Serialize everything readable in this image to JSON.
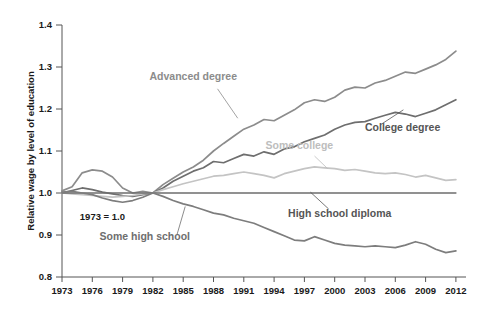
{
  "chart_data": {
    "type": "line",
    "title": "",
    "subtitle": "",
    "xlabel": "",
    "ylabel": "Relative wage by level of education",
    "xlim": [
      1973,
      2013
    ],
    "ylim": [
      0.8,
      1.4
    ],
    "grid": false,
    "legend_position": "inline-labels",
    "annotations": [
      {
        "text": "1973 = 1.0",
        "x": 1977,
        "y": 0.935
      }
    ],
    "xticks": [
      "1973",
      "1976",
      "1979",
      "1982",
      "1985",
      "1988",
      "1991",
      "1994",
      "1997",
      "2000",
      "2003",
      "2006",
      "2009",
      "2012"
    ],
    "yticks": [
      "0.8",
      "0.9",
      "1.0",
      "1.1",
      "1.2",
      "1.3",
      "1.4"
    ],
    "x": [
      1973,
      1974,
      1975,
      1976,
      1977,
      1978,
      1979,
      1980,
      1981,
      1982,
      1983,
      1984,
      1985,
      1986,
      1987,
      1988,
      1989,
      1990,
      1991,
      1992,
      1993,
      1994,
      1995,
      1996,
      1997,
      1998,
      1999,
      2000,
      2001,
      2002,
      2003,
      2004,
      2005,
      2006,
      2007,
      2008,
      2009,
      2010,
      2011,
      2012
    ],
    "series": [
      {
        "name": "Advanced degree",
        "color": "#8c8c8c",
        "label_color": "#8c8c8c",
        "label_x": 1986,
        "label_y": 1.268,
        "leader": {
          "x1": 1988.4,
          "y1": 1.248,
          "x2": 1990.4,
          "y2": 1.178
        },
        "values": [
          1.005,
          1.015,
          1.048,
          1.055,
          1.052,
          1.038,
          1.012,
          1.0,
          1.004,
          1.0,
          1.02,
          1.035,
          1.05,
          1.062,
          1.078,
          1.1,
          1.118,
          1.135,
          1.152,
          1.162,
          1.175,
          1.172,
          1.185,
          1.198,
          1.215,
          1.222,
          1.218,
          1.228,
          1.245,
          1.252,
          1.25,
          1.262,
          1.268,
          1.278,
          1.288,
          1.285,
          1.295,
          1.305,
          1.318,
          1.338
        ]
      },
      {
        "name": "College degree",
        "color": "#6e6e6e",
        "label_color": "#555555",
        "label_x": 2003,
        "label_y": 1.148,
        "leader": {
          "x1": 2004.5,
          "y1": 1.162,
          "x2": 2006.8,
          "y2": 1.198
        },
        "values": [
          1.0,
          1.006,
          1.012,
          1.008,
          1.002,
          0.998,
          0.994,
          0.992,
          0.996,
          1.0,
          1.012,
          1.028,
          1.04,
          1.052,
          1.06,
          1.075,
          1.072,
          1.082,
          1.092,
          1.088,
          1.098,
          1.092,
          1.105,
          1.11,
          1.122,
          1.13,
          1.138,
          1.152,
          1.162,
          1.168,
          1.17,
          1.178,
          1.185,
          1.192,
          1.188,
          1.182,
          1.19,
          1.198,
          1.21,
          1.222
        ]
      },
      {
        "name": "Some college",
        "color": "#c4c4c4",
        "label_color": "#bdbdbd",
        "label_x": 1996.5,
        "label_y": 1.105,
        "leader": {
          "x1": 1998.0,
          "y1": 1.088,
          "x2": 1999.3,
          "y2": 1.058
        },
        "values": [
          1.0,
          0.998,
          0.996,
          0.994,
          0.992,
          0.99,
          0.992,
          0.994,
          0.998,
          1.0,
          1.008,
          1.015,
          1.022,
          1.028,
          1.034,
          1.04,
          1.042,
          1.046,
          1.05,
          1.046,
          1.042,
          1.036,
          1.046,
          1.052,
          1.058,
          1.062,
          1.06,
          1.058,
          1.054,
          1.056,
          1.052,
          1.048,
          1.046,
          1.048,
          1.044,
          1.038,
          1.042,
          1.036,
          1.03,
          1.032
        ]
      },
      {
        "name": "High school diploma",
        "color": "#6e6e6e",
        "label_color": "#555555",
        "label_x": 2000.5,
        "label_y": 0.944,
        "leader": {
          "x1": 1999.4,
          "y1": 0.962,
          "x2": 1997.6,
          "y2": 1.002
        },
        "values": [
          1.0,
          1.0,
          1.0,
          1.0,
          1.0,
          1.0,
          1.0,
          1.0,
          1.0,
          1.0,
          1.0,
          1.0,
          1.0,
          1.0,
          1.0,
          1.0,
          1.0,
          1.0,
          1.0,
          1.0,
          1.0,
          1.0,
          1.0,
          1.0,
          1.0,
          1.0,
          1.0,
          1.0,
          1.0,
          1.0,
          1.0,
          1.0,
          1.0,
          1.0,
          1.0,
          1.0,
          1.0,
          1.0,
          1.0,
          1.0
        ]
      },
      {
        "name": "Some high school",
        "color": "#7d7d7d",
        "label_color": "#6e6e6e",
        "label_x": 1981.2,
        "label_y": 0.889,
        "leader": {
          "x1": 1984.4,
          "y1": 0.902,
          "x2": 1985.2,
          "y2": 0.968
        },
        "values": [
          1.002,
          1.004,
          1.0,
          0.996,
          0.988,
          0.982,
          0.978,
          0.982,
          0.99,
          1.0,
          0.992,
          0.982,
          0.974,
          0.968,
          0.96,
          0.952,
          0.948,
          0.94,
          0.934,
          0.928,
          0.918,
          0.908,
          0.898,
          0.888,
          0.886,
          0.896,
          0.888,
          0.88,
          0.876,
          0.874,
          0.872,
          0.874,
          0.872,
          0.87,
          0.876,
          0.884,
          0.878,
          0.866,
          0.858,
          0.862
        ]
      }
    ]
  }
}
